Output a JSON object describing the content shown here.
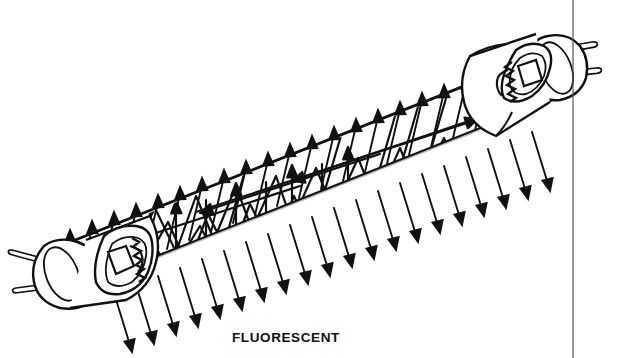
{
  "figure": {
    "title_caption": "FLUORESCENT",
    "caption_position": {
      "x": 232,
      "y": 330
    },
    "view": "diagonal cutaway line drawing",
    "canvas": {
      "width": 619,
      "height": 358
    },
    "colors": {
      "ink": "#111111",
      "background": "#ffffff",
      "rule": "#555555"
    },
    "tube": {
      "axis_start": {
        "x": 58,
        "y": 268
      },
      "axis_end": {
        "x": 538,
        "y": 78
      },
      "angle_deg": -21.6,
      "half_width": 26,
      "wall_stroke": 2.6
    },
    "border_rule": {
      "orientation": "vertical",
      "x": 573,
      "y_start": 0,
      "y_end": 358,
      "stroke": 1.2
    },
    "electrodes": [
      {
        "name": "left-electrode-cap",
        "side": "left",
        "center": {
          "x": 78,
          "y": 262
        },
        "pins": 2
      },
      {
        "name": "right-electrode-cap",
        "side": "right",
        "center": {
          "x": 528,
          "y": 80
        },
        "pins": 2
      }
    ],
    "emission": {
      "upper_arrow_count": 22,
      "lower_arrow_count": 20,
      "arrow_length": 56,
      "upper_tilt_deg": 12,
      "lower_tilt_deg": 20,
      "description": "light emitted perpendicular to tube surface on both sides"
    },
    "internal_rays": {
      "count": 26,
      "description": "zigzag photon paths reflecting between tube walls, terminating in arrowheads"
    }
  }
}
